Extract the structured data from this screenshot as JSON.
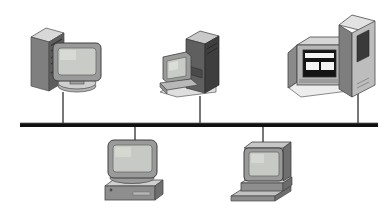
{
  "diagram": {
    "type": "network-topology",
    "background_color": "#ffffff",
    "palette": {
      "bus_line": "#111111",
      "drop_line": "#555555",
      "case_front": "#8e8e8e",
      "case_top": "#d8d8d8",
      "case_side": "#5d5d5d",
      "case_dark_front": "#6a6a6a",
      "case_dark_side": "#3e3e3e",
      "monitor_bezel": "#9a9a9a",
      "monitor_bezel_dark": "#7a7a7a",
      "screen": "#c9ccc6",
      "screen_dark": "#1a1a1a",
      "screen_highlight": "#f2f2f2",
      "base_light": "#e4e4e4",
      "outline": "#4a4a4a"
    },
    "bus": {
      "label": "network-bus",
      "x_start": 20,
      "x_end": 378,
      "y": 125,
      "thickness": 4
    },
    "links": [
      {
        "name": "link-file-server",
        "x": 63,
        "y_from": 92,
        "y_to": 125,
        "direction": "up"
      },
      {
        "name": "link-tower-workstation",
        "x": 200,
        "y_from": 96,
        "y_to": 125,
        "direction": "up"
      },
      {
        "name": "link-mainframe-terminal",
        "x": 358,
        "y_from": 94,
        "y_to": 125,
        "direction": "up"
      },
      {
        "name": "link-desktop-pc",
        "x": 135,
        "y_from": 125,
        "y_to": 157,
        "direction": "down"
      },
      {
        "name": "link-slim-workstation",
        "x": 263,
        "y_from": 125,
        "y_to": 155,
        "direction": "down"
      }
    ],
    "nodes": [
      {
        "id": "file-server",
        "label": "File server with tower case and CRT monitor",
        "position": "top-left",
        "kind": "tower-and-monitor"
      },
      {
        "id": "tower-workstation",
        "label": "Dark tower server with console monitor",
        "position": "top-center",
        "kind": "tower-and-console"
      },
      {
        "id": "mainframe-terminal",
        "label": "Large terminal display with adjacent tower unit",
        "position": "top-right",
        "kind": "terminal-and-tower"
      },
      {
        "id": "desktop-pc",
        "label": "Desktop PC with monitor on horizontal case",
        "position": "bottom-left",
        "kind": "monitor-on-case"
      },
      {
        "id": "slim-workstation",
        "label": "Workstation with monitor and keyboard",
        "position": "bottom-right",
        "kind": "monitor-and-keyboard"
      }
    ]
  }
}
